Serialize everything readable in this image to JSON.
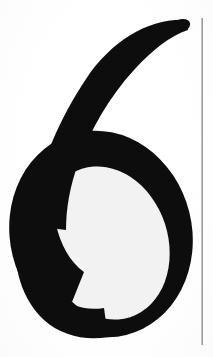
{
  "page": {
    "kind": "scanned-handwriting-sample",
    "width": 213,
    "height": 357,
    "background_color": "#fefefe",
    "caption": "6"
  },
  "glyph": {
    "character": "6",
    "name": "handwritten-digit-six",
    "ink_color": "#0d0d0d",
    "style": "cursive-brush",
    "bounds": {
      "x": 10,
      "y": 18,
      "width": 182,
      "height": 320
    },
    "counter": {
      "name": "inner-counter",
      "fill_color": "#fefefe",
      "center_x": 106,
      "center_y": 243,
      "radius_x": 62,
      "radius_y": 78,
      "rotation_deg": -18
    },
    "tail": {
      "name": "ascending-tail",
      "start_x": 186,
      "start_y": 21,
      "end_x": 38,
      "end_y": 178
    }
  },
  "rule": {
    "name": "vertical-ruled-line",
    "color": "#9b9b9b",
    "x": 202,
    "y_start": 18,
    "y_end": 345,
    "thickness": 1.6
  }
}
